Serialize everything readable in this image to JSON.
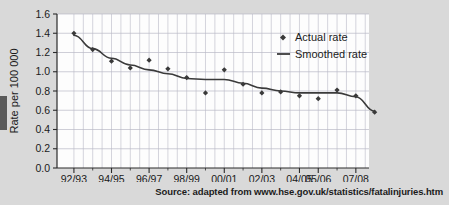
{
  "figure": {
    "background_color": "#d9d9d9",
    "plot_background_color": "#fdfdfd",
    "axis_color": "#2a2a2a",
    "grid_color": "#b9b9c6",
    "series_color": "#3a3a3a"
  },
  "source": {
    "text": "Source: adapted from www.hse.gov.uk/statistics/fatalinjuries.htm"
  },
  "chart_data": {
    "type": "line",
    "title": "",
    "xlabel": "",
    "ylabel": "Rate per 100 000",
    "ylim": [
      0.0,
      1.6
    ],
    "yticks": [
      "0.0",
      "0.2",
      "0.4",
      "0.6",
      "0.8",
      "1.0",
      "1.2",
      "1.4",
      "1.6"
    ],
    "ytick_values": [
      0.0,
      0.2,
      0.4,
      0.6,
      0.8,
      1.0,
      1.2,
      1.4,
      1.6
    ],
    "grid": true,
    "legend_position": "upper right",
    "categories": [
      "92/93",
      "93/94",
      "94/95",
      "95/96",
      "96/97",
      "97/98",
      "98/99",
      "99/00",
      "00/01",
      "01/02",
      "02/03",
      "03/04",
      "04/05",
      "05/06",
      "06/07",
      "07/08"
    ],
    "xtick_labels": [
      "92/93",
      "94/95",
      "96/97",
      "98/99",
      "00/01",
      "02/03",
      "04/05",
      "05/06",
      "07/08"
    ],
    "xtick_positions": [
      0,
      2,
      4,
      6,
      8,
      10,
      12,
      13,
      15
    ],
    "series": [
      {
        "name": "Actual rate",
        "marker": "diamond",
        "style": "points",
        "values": [
          1.4,
          1.23,
          1.11,
          1.04,
          1.12,
          1.03,
          0.94,
          0.78,
          1.02,
          0.87,
          0.78,
          0.79,
          0.75,
          0.72,
          0.81,
          0.75
        ]
      },
      {
        "name": "Smoothed rate",
        "marker": "none",
        "style": "line",
        "values": [
          1.38,
          1.24,
          1.14,
          1.07,
          1.02,
          0.98,
          0.93,
          0.92,
          0.92,
          0.88,
          0.83,
          0.8,
          0.78,
          0.78,
          0.78,
          0.74
        ]
      }
    ],
    "final_point": {
      "category": "07/08",
      "actual": 0.58
    },
    "annotations": []
  },
  "legend": {
    "entries": [
      {
        "label": "Actual rate",
        "symbol": "diamond-marker"
      },
      {
        "label": "Smoothed rate",
        "symbol": "line-segment"
      }
    ]
  }
}
